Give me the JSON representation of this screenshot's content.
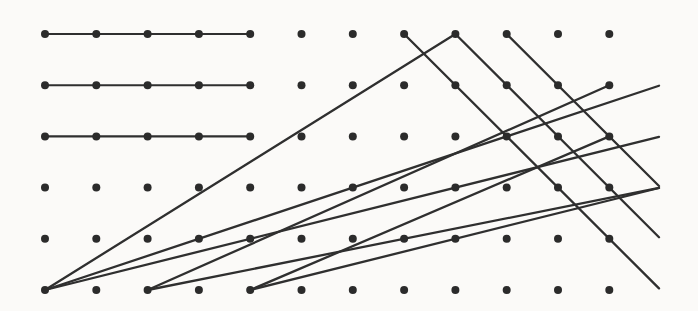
{
  "figure": {
    "background_color": "#fdfdfc",
    "dot_color": "#2b2b2b",
    "line_color": "#2f2f2f",
    "width": 698,
    "height": 311
  },
  "grid": {
    "columns": 12,
    "rows": 6,
    "origin_x": 45,
    "origin_y": 34,
    "spacing_x": 51.3,
    "spacing_y": 51.2,
    "dot_radius": 4.0
  },
  "chart_data": {
    "type": "scatter",
    "xlabel": "",
    "ylabel": "",
    "grid": true,
    "legend": "none",
    "xlim": [
      0,
      11
    ],
    "ylim": [
      0,
      5
    ],
    "columns": 12,
    "rows": 6,
    "points_note": "12 by 6 array of lattice points, columns indexed 0-11 left to right, rows indexed 0-5 top to bottom",
    "segments": [
      {
        "name": "horizontal-row-0",
        "kind": "horizontal",
        "from_col": 0,
        "from_row": 0,
        "to_col": 4,
        "to_row": 0,
        "slope": 0
      },
      {
        "name": "horizontal-row-1",
        "kind": "horizontal",
        "from_col": 0,
        "from_row": 1,
        "to_col": 4,
        "to_row": 1,
        "slope": 0
      },
      {
        "name": "horizontal-row-2",
        "kind": "horizontal",
        "from_col": 0,
        "from_row": 2,
        "to_col": 4,
        "to_row": 2,
        "slope": 0
      },
      {
        "name": "ascending-a",
        "kind": "ascending",
        "from_col": 0,
        "from_row": 5,
        "to_col": 8,
        "to_row": 0,
        "slope": 0.625
      },
      {
        "name": "ascending-b",
        "kind": "ascending",
        "from_col": 0,
        "from_row": 5,
        "to_col": 12,
        "to_row": 1,
        "slope": 0.333
      },
      {
        "name": "ascending-c",
        "kind": "ascending",
        "from_col": 0,
        "from_row": 5,
        "to_col": 12,
        "to_row": 2,
        "slope": 0.25
      },
      {
        "name": "ascending-d",
        "kind": "ascending",
        "from_col": 2,
        "from_row": 5,
        "to_col": 11,
        "to_row": 1,
        "slope": 0.444
      },
      {
        "name": "ascending-e",
        "kind": "ascending",
        "from_col": 2,
        "from_row": 5,
        "to_col": 12,
        "to_row": 3,
        "slope": 0.2
      },
      {
        "name": "ascending-f",
        "kind": "ascending",
        "from_col": 4,
        "from_row": 5,
        "to_col": 11,
        "to_row": 2,
        "slope": 0.4286
      },
      {
        "name": "ascending-g",
        "kind": "ascending",
        "from_col": 4,
        "from_row": 5,
        "to_col": 12,
        "to_row": 3,
        "slope": 0.25
      },
      {
        "name": "descending-a",
        "kind": "descending",
        "from_col": 7,
        "from_row": 0,
        "to_col": 12,
        "to_row": 5,
        "slope": -1.0
      },
      {
        "name": "descending-b",
        "kind": "descending",
        "from_col": 8,
        "from_row": 0,
        "to_col": 12,
        "to_row": 4,
        "slope": -1.0
      },
      {
        "name": "descending-c",
        "kind": "descending",
        "from_col": 9,
        "from_row": 0,
        "to_col": 12,
        "to_row": 3,
        "slope": -1.0
      }
    ]
  }
}
